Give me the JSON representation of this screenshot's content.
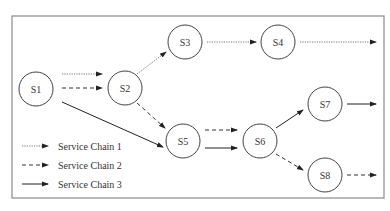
{
  "diagram": {
    "type": "service-chain-graph",
    "frame": {
      "x": 12,
      "y": 16,
      "width": 372,
      "height": 182
    },
    "colors": {
      "border": "#8a8a8a",
      "node_stroke": "#444444",
      "chain1": "#666666",
      "chain2": "#333333",
      "chain3": "#222222",
      "text": "#333333"
    },
    "nodes": [
      {
        "id": "S1",
        "label": "S1",
        "cx": 36,
        "cy": 89,
        "r": 17
      },
      {
        "id": "S2",
        "label": "S2",
        "cx": 125,
        "cy": 88,
        "r": 17
      },
      {
        "id": "S3",
        "label": "S3",
        "cx": 185,
        "cy": 42,
        "r": 17
      },
      {
        "id": "S4",
        "label": "S4",
        "cx": 278,
        "cy": 42,
        "r": 17
      },
      {
        "id": "S5",
        "label": "S5",
        "cx": 183,
        "cy": 141,
        "r": 17
      },
      {
        "id": "S6",
        "label": "S6",
        "cx": 260,
        "cy": 141,
        "r": 17
      },
      {
        "id": "S7",
        "label": "S7",
        "cx": 325,
        "cy": 104,
        "r": 17
      },
      {
        "id": "S8",
        "label": "S8",
        "cx": 325,
        "cy": 175,
        "r": 17
      }
    ],
    "edges": [
      {
        "chain": 1,
        "from": "S1",
        "to": "S2",
        "x1": 62,
        "y1": 74,
        "x2": 102,
        "y2": 74
      },
      {
        "chain": 2,
        "from": "S1",
        "to": "S2",
        "x1": 62,
        "y1": 88,
        "x2": 102,
        "y2": 88
      },
      {
        "chain": 3,
        "from": "S1",
        "to": "S5",
        "x1": 62,
        "y1": 102,
        "x2": 163,
        "y2": 147
      },
      {
        "chain": 1,
        "from": "S2",
        "to": "S3",
        "x1": 137,
        "y1": 74,
        "x2": 166,
        "y2": 52
      },
      {
        "chain": 1,
        "from": "S3",
        "to": "S4",
        "x1": 207,
        "y1": 42,
        "x2": 256,
        "y2": 42
      },
      {
        "chain": 1,
        "from": "S4",
        "to": "out",
        "x1": 300,
        "y1": 42,
        "x2": 376,
        "y2": 42
      },
      {
        "chain": 2,
        "from": "S2",
        "to": "S5",
        "x1": 137,
        "y1": 103,
        "x2": 165,
        "y2": 128
      },
      {
        "chain": 2,
        "from": "S5",
        "to": "S6",
        "x1": 205,
        "y1": 130,
        "x2": 237,
        "y2": 130
      },
      {
        "chain": 3,
        "from": "S5",
        "to": "S6",
        "x1": 205,
        "y1": 148,
        "x2": 237,
        "y2": 148
      },
      {
        "chain": 3,
        "from": "S6",
        "to": "S7",
        "x1": 276,
        "y1": 128,
        "x2": 303,
        "y2": 110
      },
      {
        "chain": 3,
        "from": "S7",
        "to": "out",
        "x1": 347,
        "y1": 104,
        "x2": 376,
        "y2": 104
      },
      {
        "chain": 2,
        "from": "S6",
        "to": "S8",
        "x1": 276,
        "y1": 154,
        "x2": 303,
        "y2": 170
      },
      {
        "chain": 2,
        "from": "S8",
        "to": "out",
        "x1": 347,
        "y1": 175,
        "x2": 376,
        "y2": 175
      }
    ],
    "legend": {
      "items": [
        {
          "chain": 1,
          "label": "Service Chain 1",
          "y": 146
        },
        {
          "chain": 2,
          "label": "Service Chain 2",
          "y": 165
        },
        {
          "chain": 3,
          "label": "Service Chain 3",
          "y": 184
        }
      ]
    }
  }
}
